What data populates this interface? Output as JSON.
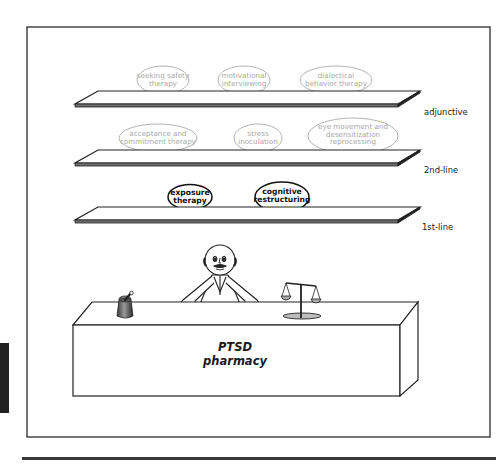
{
  "figure": {
    "title_line1": "PTSD",
    "title_line2": "pharmacy",
    "shelves": [
      {
        "tier": "adjunctive",
        "treatments": [
          {
            "line1": "seeking safety",
            "line2": "therapy",
            "line3": "",
            "emphasis": "secondary"
          },
          {
            "line1": "motivational",
            "line2": "interviewing",
            "line3": "",
            "emphasis": "secondary"
          },
          {
            "line1": "dialectical",
            "line2": "behavior therapy",
            "line3": "",
            "emphasis": "secondary"
          }
        ]
      },
      {
        "tier": "2nd-line",
        "treatments": [
          {
            "line1": "acceptance and",
            "line2": "commitment therapy",
            "line3": "",
            "emphasis": "secondary"
          },
          {
            "line1": "stress",
            "line2": "inoculation",
            "line3": "",
            "emphasis": "secondary"
          },
          {
            "line1": "eye movement and",
            "line2": "desensitization",
            "line3": "reprocessing",
            "emphasis": "secondary"
          }
        ]
      },
      {
        "tier": "1st-line",
        "treatments": [
          {
            "line1": "exposure",
            "line2": "therapy",
            "line3": "",
            "emphasis": "primary"
          },
          {
            "line1": "cognitive",
            "line2": "restructuring",
            "line3": "",
            "emphasis": "primary"
          }
        ]
      }
    ],
    "props": [
      "pharmacist-figure",
      "mortar-and-pestle",
      "balance-scale",
      "pharmacy-counter"
    ],
    "colors": {
      "frame": "#3a3a3a",
      "shelf_edge": "#222222",
      "shelf_front": "#6e6e6e",
      "secondary_oval": "#b4b4b4",
      "secondary_text": "#a8a8a8",
      "primary_oval": "#111111",
      "primary_text": "#111111"
    }
  }
}
